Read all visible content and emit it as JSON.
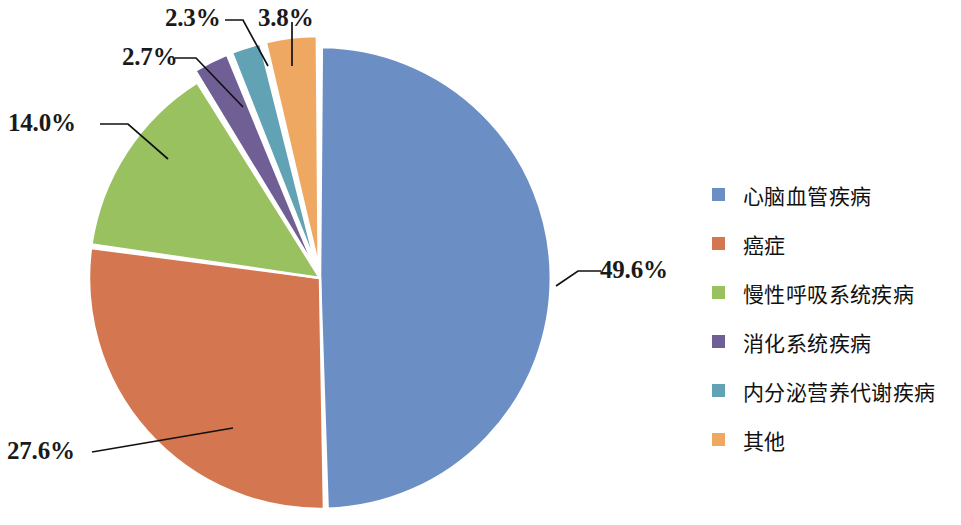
{
  "chart_data": {
    "type": "pie",
    "title": "",
    "categories": [
      "心脑血管疾病",
      "癌症",
      "慢性呼吸系统疾病",
      "消化系统疾病",
      "内分泌营养代谢疾病",
      "其他"
    ],
    "values": [
      49.6,
      27.6,
      14.0,
      2.7,
      2.3,
      3.8
    ],
    "value_labels": [
      "49.6%",
      "27.6%",
      "14.0%",
      "2.7%",
      "2.3%",
      "3.8%"
    ],
    "colors": [
      "#6b8fc4",
      "#d4764f",
      "#9ac15f",
      "#6f5f94",
      "#62a2b5",
      "#efa861"
    ],
    "unit": "%",
    "legend_position": "right",
    "start_angle_deg": 0,
    "direction": "clockwise",
    "grid": false
  },
  "slices": [
    {
      "label": "心脑血管疾病",
      "value": 49.6,
      "value_label": "49.6%",
      "color": "#6b8fc4"
    },
    {
      "label": "癌症",
      "value": 27.6,
      "value_label": "27.6%",
      "color": "#d4764f"
    },
    {
      "label": "慢性呼吸系统疾病",
      "value": 14.0,
      "value_label": "14.0%",
      "color": "#9ac15f"
    },
    {
      "label": "消化系统疾病",
      "value": 2.7,
      "value_label": "2.7%",
      "color": "#6f5f94"
    },
    {
      "label": "内分泌营养代谢疾病",
      "value": 2.3,
      "value_label": "2.3%",
      "color": "#62a2b5"
    },
    {
      "label": "其他",
      "value": 3.8,
      "value_label": "3.8%",
      "color": "#efa861"
    }
  ],
  "legend": {
    "items": [
      {
        "label": "心脑血管疾病",
        "color": "#6b8fc4"
      },
      {
        "label": "癌症",
        "color": "#d4764f"
      },
      {
        "label": "慢性呼吸系统疾病",
        "color": "#9ac15f"
      },
      {
        "label": "消化系统疾病",
        "color": "#6f5f94"
      },
      {
        "label": "内分泌营养代谢疾病",
        "color": "#62a2b5"
      },
      {
        "label": "其他",
        "color": "#efa861"
      }
    ]
  },
  "labels": {
    "blue": "49.6%",
    "red": "27.6%",
    "green": "14.0%",
    "purple": "2.7%",
    "teal": "2.3%",
    "orange": "3.8%"
  }
}
